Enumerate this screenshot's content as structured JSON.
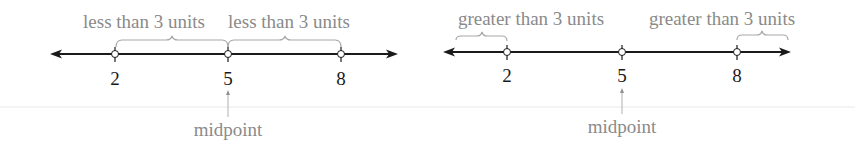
{
  "diagrams": [
    {
      "title": "",
      "point_labels": [
        "2",
        "5",
        "8"
      ],
      "distance_labels": [
        "less than 3 units",
        "less than 3 units"
      ],
      "midpoint_label": "midpoint",
      "midpoint_value": "5"
    },
    {
      "title": "",
      "point_labels": [
        "2",
        "5",
        "8"
      ],
      "distance_labels": [
        "greater than 3 units",
        "greater than 3 units"
      ],
      "midpoint_label": "midpoint",
      "midpoint_value": "5"
    }
  ],
  "colors": {
    "line": "#1a1a1a",
    "annotation": "#8a8a8a",
    "brace": "#a8a8a8"
  }
}
